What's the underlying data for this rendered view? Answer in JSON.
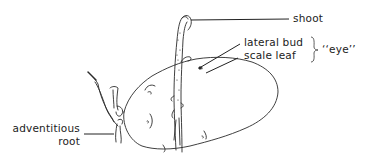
{
  "figure": {
    "labels": {
      "shoot": "shoot",
      "lateral_bud": "lateral bud",
      "scale_leaf": "scale leaf",
      "eye": "‘‘eye’’",
      "adventitious_line1": "adventitious",
      "adventitious_line2": "root"
    },
    "ink_color": "#222222"
  }
}
